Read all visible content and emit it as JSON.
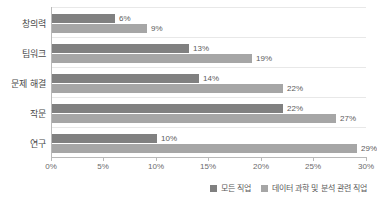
{
  "chart_data": {
    "type": "bar",
    "orientation": "horizontal",
    "title": "",
    "subtitle": "",
    "xlabel": "",
    "ylabel": "",
    "categories": [
      "창의력",
      "팀워크",
      "문제 해결",
      "작문",
      "연구"
    ],
    "series": [
      {
        "name": "모든 직업",
        "color": "#808080",
        "values": [
          6,
          13,
          14,
          22,
          10
        ],
        "labels": [
          "6%",
          "13%",
          "14%",
          "22%",
          "10%"
        ]
      },
      {
        "name": "데이터 과학 및 분석 관련 직업",
        "color": "#a6a6a6",
        "values": [
          9,
          19,
          22,
          27,
          29
        ],
        "labels": [
          "9%",
          "19%",
          "22%",
          "27%",
          "29%"
        ]
      }
    ],
    "xlim": [
      0,
      30
    ],
    "xticks": [
      0,
      5,
      10,
      15,
      20,
      25,
      30
    ],
    "xtick_labels": [
      "0%",
      "5%",
      "10%",
      "15%",
      "20%",
      "25%",
      "30%"
    ],
    "grid": true,
    "grid_axis": "y",
    "legend_position": "bottom-right",
    "value_suffix": "%"
  }
}
